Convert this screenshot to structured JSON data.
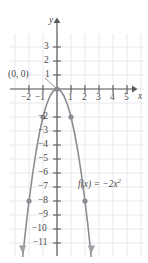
{
  "figure": {
    "axis_labels": {
      "x": "x",
      "y": "y"
    },
    "point_label": "(0, 0)",
    "function_label": {
      "lhs": "f(x) = −2x",
      "exponent": "2"
    },
    "colors": {
      "grid": "#e3e3e8",
      "axis": "#59595c",
      "curve": "#8c8c93",
      "point": "#8c8c93",
      "text": "#4a4a4a",
      "background": "#ffffff"
    }
  },
  "chart_data": {
    "type": "line",
    "title": "",
    "xlabel": "x",
    "ylabel": "y",
    "expression": "f(x) = -2x^2",
    "xlim": [
      -2.9,
      5.9
    ],
    "ylim": [
      -11.9,
      3.9
    ],
    "grid": true,
    "legend": "none",
    "xticks": [
      -2,
      -1,
      1,
      2,
      3,
      4,
      5
    ],
    "xtick_labels": [
      "−2",
      "−1",
      "1",
      "2",
      "3",
      "4",
      "5"
    ],
    "yticks": [
      3,
      2,
      1,
      -2,
      -3,
      -4,
      -5,
      -6,
      -7,
      -8,
      -9,
      -10,
      -11
    ],
    "ytick_labels": [
      "3",
      "2",
      "1",
      "−2",
      "−3",
      "−4",
      "−5",
      "−6",
      "−7",
      "−8",
      "−9",
      "−10",
      "−11"
    ],
    "series": [
      {
        "name": "f(x) = -2x^2",
        "x": [
          -2.45,
          -2.2,
          -2.0,
          -1.75,
          -1.5,
          -1.25,
          -1.0,
          -0.75,
          -0.5,
          -0.25,
          0,
          0.25,
          0.5,
          0.75,
          1.0,
          1.25,
          1.5,
          1.75,
          2.0,
          2.2,
          2.45
        ],
        "y": [
          -12.0,
          -9.68,
          -8.0,
          -6.125,
          -4.5,
          -3.125,
          -2.0,
          -1.125,
          -0.5,
          -0.125,
          0,
          -0.125,
          -0.5,
          -1.125,
          -2.0,
          -3.125,
          -4.5,
          -6.125,
          -8.0,
          -9.68,
          -12.0
        ]
      }
    ],
    "marked_points": [
      {
        "x": 0,
        "y": 0,
        "label": "(0, 0)"
      },
      {
        "x": -1,
        "y": -2,
        "label": ""
      },
      {
        "x": 1,
        "y": -2,
        "label": ""
      },
      {
        "x": -2,
        "y": -8,
        "label": ""
      },
      {
        "x": 2,
        "y": -8,
        "label": ""
      }
    ],
    "annotations": [
      {
        "text": "f(x) = −2x²",
        "x": 3.1,
        "y": -6.6
      },
      {
        "text": "(0, 0)",
        "x": -2.9,
        "y": 1.1
      }
    ]
  }
}
